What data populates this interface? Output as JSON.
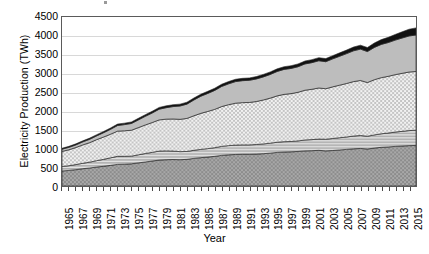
{
  "axes": {
    "ylabel": "Electricity Production (TWh)",
    "xlabel": "Year",
    "yticks": [
      "0",
      "500",
      "1000",
      "1500",
      "2000",
      "2500",
      "3000",
      "3500",
      "4000",
      "4500"
    ],
    "xticklabels": [
      "1965",
      "1967",
      "1969",
      "1971",
      "1973",
      "1975",
      "1977",
      "1979",
      "1981",
      "1983",
      "1985",
      "1987",
      "1989",
      "1991",
      "1993",
      "1995",
      "1997",
      "1999",
      "2001",
      "2003",
      "2005",
      "2007",
      "2009",
      "2011",
      "2013",
      "2015"
    ]
  },
  "chart_data": {
    "type": "area",
    "title": "",
    "xlabel": "Year",
    "ylabel": "Electricity Production (TWh)",
    "ylim": [
      0,
      4500
    ],
    "xlim": [
      1965,
      2016
    ],
    "grid": true,
    "legend": "none",
    "stacked": true,
    "x": [
      1965,
      1966,
      1967,
      1968,
      1969,
      1970,
      1971,
      1972,
      1973,
      1974,
      1975,
      1976,
      1977,
      1978,
      1979,
      1980,
      1981,
      1982,
      1983,
      1984,
      1985,
      1986,
      1987,
      1988,
      1989,
      1990,
      1991,
      1992,
      1993,
      1994,
      1995,
      1996,
      1997,
      1998,
      1999,
      2000,
      2001,
      2002,
      2003,
      2004,
      2005,
      2006,
      2007,
      2008,
      2009,
      2010,
      2011,
      2012,
      2013,
      2014,
      2015,
      2016
    ],
    "series": [
      {
        "name": "band-1-bottom",
        "pattern": "dark-gray-dotted",
        "color": "#9e9e9e",
        "values": [
          400,
          415,
          435,
          460,
          480,
          505,
          525,
          550,
          575,
          580,
          590,
          615,
          640,
          665,
          690,
          700,
          705,
          700,
          710,
          735,
          755,
          770,
          790,
          815,
          830,
          840,
          845,
          845,
          850,
          860,
          875,
          895,
          905,
          910,
          920,
          935,
          940,
          950,
          935,
          945,
          960,
          975,
          990,
          1000,
          985,
          1010,
          1030,
          1040,
          1055,
          1065,
          1075,
          1080
        ]
      },
      {
        "name": "band-2",
        "pattern": "horizontal-lines",
        "color": "#c8c8c8",
        "values": [
          120,
          125,
          135,
          145,
          155,
          170,
          185,
          200,
          215,
          210,
          205,
          215,
          225,
          230,
          240,
          235,
          225,
          215,
          210,
          215,
          220,
          225,
          230,
          240,
          245,
          250,
          250,
          250,
          255,
          260,
          265,
          270,
          275,
          275,
          280,
          290,
          295,
          300,
          310,
          320,
          325,
          330,
          340,
          345,
          340,
          350,
          360,
          370,
          380,
          390,
          400,
          405
        ]
      },
      {
        "name": "band-3",
        "pattern": "light-checker",
        "color": "#e0e0e0",
        "values": [
          400,
          425,
          455,
          490,
          520,
          560,
          595,
          630,
          670,
          680,
          690,
          725,
          760,
          795,
          830,
          845,
          855,
          860,
          880,
          920,
          960,
          990,
          1020,
          1060,
          1090,
          1115,
          1125,
          1130,
          1145,
          1170,
          1200,
          1235,
          1260,
          1275,
          1295,
          1325,
          1340,
          1360,
          1345,
          1375,
          1400,
          1425,
          1450,
          1465,
          1430,
          1470,
          1495,
          1510,
          1530,
          1545,
          1560,
          1565
        ]
      },
      {
        "name": "band-4",
        "pattern": "solid-medium-gray",
        "color": "#b5b5b5",
        "values": [
          60,
          65,
          70,
          80,
          90,
          100,
          115,
          130,
          150,
          165,
          180,
          205,
          230,
          255,
          285,
          305,
          330,
          355,
          380,
          420,
          455,
          480,
          505,
          535,
          555,
          575,
          585,
          590,
          600,
          615,
          630,
          650,
          665,
          670,
          680,
          700,
          710,
          725,
          720,
          745,
          770,
          795,
          820,
          835,
          825,
          860,
          885,
          900,
          920,
          940,
          960,
          970
        ]
      },
      {
        "name": "band-5-top",
        "pattern": "black",
        "color": "#111111",
        "values": [
          25,
          26,
          27,
          28,
          30,
          32,
          34,
          36,
          38,
          39,
          40,
          42,
          44,
          46,
          48,
          49,
          50,
          50,
          51,
          53,
          55,
          56,
          58,
          60,
          61,
          62,
          62,
          63,
          64,
          66,
          68,
          70,
          72,
          73,
          75,
          78,
          80,
          82,
          82,
          86,
          90,
          95,
          100,
          105,
          108,
          118,
          128,
          138,
          150,
          165,
          180,
          190
        ]
      }
    ],
    "totals": [
      1005,
      1056,
      1122,
      1203,
      1275,
      1367,
      1454,
      1546,
      1648,
      1674,
      1705,
      1802,
      1899,
      1991,
      2093,
      2134,
      2165,
      2180,
      2231,
      2343,
      2445,
      2521,
      2603,
      2710,
      2781,
      2842,
      2867,
      2878,
      2914,
      2971,
      3038,
      3120,
      3177,
      3203,
      3250,
      3328,
      3365,
      3417,
      3392,
      3471,
      3545,
      3620,
      3700,
      3750,
      3688,
      3808,
      3898,
      3958,
      4035,
      4105,
      4175,
      4210
    ]
  }
}
